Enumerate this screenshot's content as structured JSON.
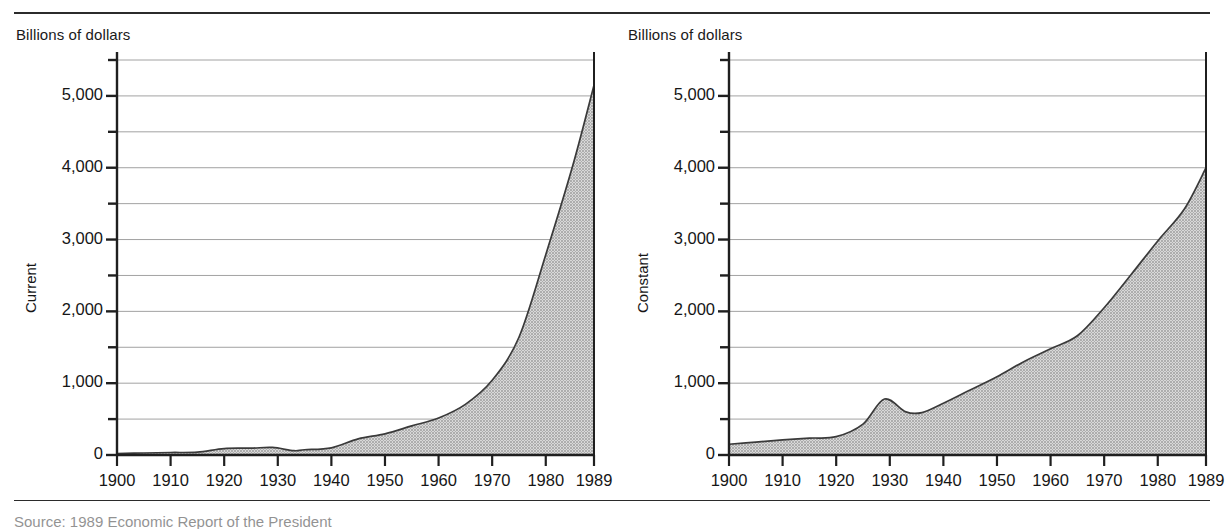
{
  "figure": {
    "rule_color": "#2b2b2b",
    "fill_color": "#b4b4b4",
    "line_color": "#3a3a3a",
    "grid_color": "#8a8a8a"
  },
  "panels": [
    {
      "id": "current",
      "unit_label": "Billions of dollars",
      "axis_title": "Current"
    },
    {
      "id": "constant",
      "unit_label": "Billions of dollars",
      "axis_title": "Constant"
    }
  ],
  "footer_partial": "Source: 1989 Economic Report of the President",
  "chart_data": [
    {
      "type": "area",
      "title": "",
      "subtitle": "",
      "panel": "Current",
      "xlabel": "",
      "ylabel": "Current",
      "unit_label": "Billions of dollars",
      "xlim": [
        1900,
        1989
      ],
      "ylim": [
        0,
        5500
      ],
      "grid": true,
      "grid_step": 500,
      "legend": "none",
      "ytick_labels": [
        "0",
        "1,000",
        "2,000",
        "3,000",
        "4,000",
        "5,000"
      ],
      "ytick_values": [
        0,
        1000,
        2000,
        3000,
        4000,
        5000
      ],
      "xtick_labels": [
        "1900",
        "1910",
        "1920",
        "1930",
        "1940",
        "1950",
        "1960",
        "1970",
        "1980",
        "1989"
      ],
      "xtick_values": [
        1900,
        1910,
        1920,
        1930,
        1940,
        1950,
        1960,
        1970,
        1980,
        1989
      ],
      "x": [
        1900,
        1905,
        1910,
        1915,
        1920,
        1925,
        1929,
        1933,
        1935,
        1940,
        1945,
        1950,
        1955,
        1960,
        1965,
        1970,
        1975,
        1980,
        1985,
        1989
      ],
      "values": [
        20,
        28,
        35,
        40,
        90,
        95,
        105,
        60,
        73,
        100,
        225,
        295,
        405,
        515,
        705,
        1040,
        1640,
        2790,
        4020,
        5150
      ]
    },
    {
      "type": "area",
      "title": "",
      "subtitle": "",
      "panel": "Constant",
      "xlabel": "",
      "ylabel": "Constant",
      "unit_label": "Billions of dollars",
      "xlim": [
        1900,
        1989
      ],
      "ylim": [
        0,
        5500
      ],
      "grid": true,
      "grid_step": 500,
      "legend": "none",
      "ytick_labels": [
        "0",
        "1,000",
        "2,000",
        "3,000",
        "4,000",
        "5,000"
      ],
      "ytick_values": [
        0,
        1000,
        2000,
        3000,
        4000,
        5000
      ],
      "xtick_labels": [
        "1900",
        "1910",
        "1920",
        "1930",
        "1940",
        "1950",
        "1960",
        "1970",
        "1980",
        "1989"
      ],
      "xtick_values": [
        1900,
        1910,
        1920,
        1930,
        1940,
        1950,
        1960,
        1970,
        1980,
        1989
      ],
      "x": [
        1900,
        1905,
        1910,
        1915,
        1920,
        1925,
        1929,
        1933,
        1936,
        1940,
        1945,
        1950,
        1955,
        1960,
        1965,
        1970,
        1975,
        1980,
        1985,
        1989
      ],
      "values": [
        150,
        180,
        210,
        235,
        255,
        430,
        780,
        600,
        590,
        720,
        905,
        1090,
        1300,
        1480,
        1660,
        2050,
        2510,
        2980,
        3430,
        4000
      ]
    }
  ]
}
